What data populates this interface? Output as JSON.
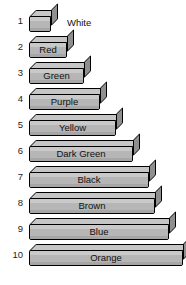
{
  "chart_data": {
    "type": "bar",
    "title": "",
    "xlabel": "",
    "ylabel": "",
    "orientation": "horizontal",
    "categories": [
      "1",
      "2",
      "3",
      "4",
      "5",
      "6",
      "7",
      "8",
      "9",
      "10"
    ],
    "values": [
      1,
      2,
      3,
      4,
      5,
      6,
      7,
      8,
      9,
      10
    ],
    "series": [
      {
        "name": "Rod length (units)",
        "values": [
          1,
          2,
          3,
          4,
          5,
          6,
          7,
          8,
          9,
          10
        ]
      }
    ],
    "point_labels": [
      "White",
      "Red",
      "Green",
      "Purple",
      "Yellow",
      "Dark Green",
      "Black",
      "Brown",
      "Blue",
      "Orange"
    ],
    "grid": false,
    "legend": "none",
    "xlim": [
      0,
      10
    ]
  },
  "rods": [
    {
      "index": "1",
      "label": "White",
      "length": 1,
      "width_px": 22,
      "label_outside": true
    },
    {
      "index": "2",
      "label": "Red",
      "length": 2,
      "width_px": 38,
      "label_outside": false
    },
    {
      "index": "3",
      "label": "Green",
      "length": 3,
      "width_px": 55,
      "label_outside": false
    },
    {
      "index": "4",
      "label": "Purple",
      "length": 4,
      "width_px": 71,
      "label_outside": false
    },
    {
      "index": "5",
      "label": "Yellow",
      "length": 5,
      "width_px": 87,
      "label_outside": false
    },
    {
      "index": "6",
      "label": "Dark Green",
      "length": 6,
      "width_px": 104,
      "label_outside": false
    },
    {
      "index": "7",
      "label": "Black",
      "length": 7,
      "width_px": 120,
      "label_outside": false
    },
    {
      "index": "8",
      "label": "Brown",
      "length": 8,
      "width_px": 126,
      "label_outside": false
    },
    {
      "index": "9",
      "label": "Blue",
      "length": 9,
      "width_px": 140,
      "label_outside": false
    },
    {
      "index": "10",
      "label": "Orange",
      "length": 10,
      "width_px": 154,
      "label_outside": false
    }
  ],
  "colors": {
    "background": "#ffffff",
    "rod_front": "#b6b6b6",
    "rod_top": "#c6c6c6",
    "rod_side": "#8f8f8f",
    "outline": "#000000",
    "text": "#111111"
  }
}
